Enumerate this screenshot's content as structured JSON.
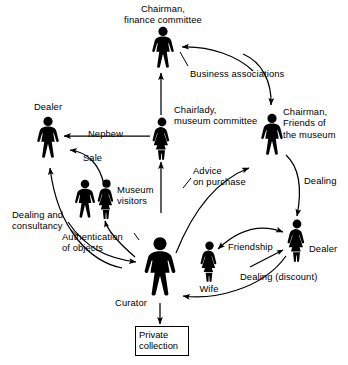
{
  "diagram": {
    "background_color": "#ffffff",
    "ink_color": "#000000",
    "nodes": [
      {
        "id": "chairman_finance",
        "label": "Chairman,\nfinance committee",
        "icon": "male-figure-icon",
        "gender": "male",
        "x": 163,
        "y": 46,
        "scale": 1.0,
        "label_x": 163,
        "label_y": 3,
        "label_align": "ctr"
      },
      {
        "id": "chairlady",
        "label": "Chairlady,\nmuseum committee",
        "icon": "female-figure-icon",
        "gender": "female",
        "x": 162,
        "y": 137,
        "scale": 1.0,
        "label_x": 174,
        "label_y": 104,
        "label_align": "left"
      },
      {
        "id": "chairman_friends",
        "label": "Chairman,\nFriends of\nthe museum",
        "icon": "male-figure-icon",
        "gender": "male",
        "x": 272,
        "y": 133,
        "scale": 1.0,
        "label_x": 283,
        "label_y": 106,
        "label_align": "left"
      },
      {
        "id": "dealer_left",
        "label": "Dealer",
        "icon": "male-figure-icon",
        "gender": "male",
        "x": 48,
        "y": 136,
        "scale": 1.0,
        "label_x": 48,
        "label_y": 101,
        "label_align": "ctr"
      },
      {
        "id": "visitor_male",
        "label": "",
        "icon": "male-figure-icon",
        "gender": "male",
        "x": 85,
        "y": 197,
        "scale": 0.92,
        "label_x": 0,
        "label_y": 0,
        "label_align": "ctr"
      },
      {
        "id": "visitor_female",
        "label": "Museum\nvisitors",
        "icon": "female-figure-icon",
        "gender": "female",
        "x": 106,
        "y": 197,
        "scale": 0.92,
        "label_x": 117,
        "label_y": 184,
        "label_align": "left"
      },
      {
        "id": "curator",
        "label": "Curator",
        "icon": "male-figure-icon",
        "gender": "male",
        "x": 160,
        "y": 266,
        "scale": 1.42,
        "label_x": 147,
        "label_y": 297,
        "label_align": "rt"
      },
      {
        "id": "wife",
        "label": "Wife",
        "icon": "female-figure-icon",
        "gender": "female",
        "x": 209,
        "y": 262,
        "scale": 0.95,
        "label_x": 209,
        "label_y": 283,
        "label_align": "ctr"
      },
      {
        "id": "dealer_right",
        "label": "Dealer",
        "icon": "female-figure-icon",
        "gender": "female",
        "x": 296,
        "y": 240,
        "scale": 1.0,
        "label_x": 309,
        "label_y": 243,
        "label_align": "left"
      }
    ],
    "box_nodes": [
      {
        "id": "private_collection",
        "label": "Private\ncollection",
        "x": 135,
        "y": 326,
        "width": 46,
        "height": 31
      }
    ],
    "edge_labels": [
      {
        "id": "business_associations",
        "text": "Business associations",
        "x": 190,
        "y": 68,
        "align": "left"
      },
      {
        "id": "nephew",
        "text": "Nephew",
        "x": 88,
        "y": 128,
        "align": "left"
      },
      {
        "id": "sale",
        "text": "Sale",
        "x": 83,
        "y": 152,
        "align": "left"
      },
      {
        "id": "advice_on_purchase",
        "text": "Advice\non purchase",
        "x": 193,
        "y": 165,
        "align": "left"
      },
      {
        "id": "dealing",
        "text": "Dealing",
        "x": 304,
        "y": 175,
        "align": "left"
      },
      {
        "id": "dealing_consultancy",
        "text": "Dealing and\nconsultancy",
        "x": 12,
        "y": 209,
        "align": "left"
      },
      {
        "id": "authentication",
        "text": "Authentication\nof objects",
        "x": 62,
        "y": 231,
        "align": "left"
      },
      {
        "id": "friendship",
        "text": "Friendship",
        "x": 228,
        "y": 241,
        "align": "left"
      },
      {
        "id": "dealing_discount",
        "text": "Dealing (discount)",
        "x": 240,
        "y": 271,
        "align": "left"
      }
    ],
    "edges": [
      {
        "id": "edge-chairmanfriends-to-chairmanfinance",
        "from": "chairman_friends",
        "to": "chairman_finance",
        "label": "business_associations",
        "style": "curved",
        "arrow": "end"
      },
      {
        "id": "edge-chairmanfinance-to-chairmanfriends",
        "from": "chairman_finance",
        "to": "chairman_friends",
        "label": "business_associations",
        "style": "curved",
        "arrow": "end"
      },
      {
        "id": "edge-chairlady-to-chairmanfinance",
        "from": "chairlady",
        "to": "chairman_finance",
        "label": "",
        "style": "straight",
        "arrow": "end"
      },
      {
        "id": "edge-chairlady-to-dealerleft",
        "from": "chairlady",
        "to": "dealer_left",
        "label": "nephew",
        "style": "straight",
        "arrow": "end"
      },
      {
        "id": "edge-visitors-to-dealerleft",
        "from": "visitor_female",
        "to": "dealer_left",
        "label": "sale",
        "style": "curved",
        "arrow": "end"
      },
      {
        "id": "edge-visitors-to-chairlady",
        "from": "visitor_female",
        "to": "chairlady",
        "label": "",
        "style": "straight",
        "arrow": "end"
      },
      {
        "id": "edge-curator-to-chairmanfriends",
        "from": "curator",
        "to": "chairman_friends",
        "label": "advice_on_purchase",
        "style": "curved",
        "arrow": "end"
      },
      {
        "id": "edge-chairmanfriends-to-dealerright",
        "from": "chairman_friends",
        "to": "dealer_right",
        "label": "dealing",
        "style": "curved",
        "arrow": "end"
      },
      {
        "id": "edge-dealerleft-to-curator",
        "from": "dealer_left",
        "to": "curator",
        "label": "dealing_consultancy",
        "style": "curved",
        "arrow": "end"
      },
      {
        "id": "edge-curator-to-dealerleft",
        "from": "curator",
        "to": "dealer_left",
        "label": "dealing_consultancy",
        "style": "curved",
        "arrow": "end"
      },
      {
        "id": "edge-curator-to-visitors",
        "from": "curator",
        "to": "visitor_female",
        "label": "authentication",
        "style": "curved",
        "arrow": "end"
      },
      {
        "id": "edge-wife-dealerright-friendship",
        "from": "wife",
        "to": "dealer_right",
        "label": "friendship",
        "style": "curved",
        "arrow": "both"
      },
      {
        "id": "edge-dealerright-to-curator",
        "from": "dealer_right",
        "to": "curator",
        "label": "dealing_discount",
        "style": "curved",
        "arrow": "end"
      },
      {
        "id": "edge-curator-to-privatecollection",
        "from": "curator",
        "to": "private_collection",
        "label": "",
        "style": "straight",
        "arrow": "end"
      }
    ]
  }
}
